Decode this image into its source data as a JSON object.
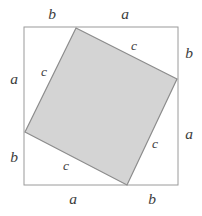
{
  "figure": {
    "type": "geometry-diagram",
    "name": "pythagorean-tilted-square",
    "background_color": "#ffffff",
    "outer_square": {
      "name": "outer-square",
      "stroke_color": "#9a9a9a",
      "fill_color": "none",
      "stroke_width": 1,
      "x": 24,
      "y": 27,
      "width": 154,
      "height": 158
    },
    "inner_square": {
      "name": "inner-tilted-square",
      "stroke_color": "#8c8c8c",
      "fill_color": "#d4d4d4",
      "stroke_width": 1.2,
      "points": "76,28 177,79 127,185 25,132"
    },
    "labels": {
      "top_left": {
        "text": "b",
        "x": 52,
        "y": 14
      },
      "top_right": {
        "text": "a",
        "x": 125,
        "y": 14
      },
      "right_top": {
        "text": "b",
        "x": 189,
        "y": 53
      },
      "right_bottom": {
        "text": "a",
        "x": 189,
        "y": 134
      },
      "bottom_right": {
        "text": "b",
        "x": 152,
        "y": 199
      },
      "bottom_left": {
        "text": "a",
        "x": 73,
        "y": 199
      },
      "left_bottom": {
        "text": "b",
        "x": 14,
        "y": 157
      },
      "left_top": {
        "text": "a",
        "x": 14,
        "y": 79
      },
      "hyp_top_right": {
        "text": "c",
        "x": 134,
        "y": 46
      },
      "hyp_right_bottom": {
        "text": "c",
        "x": 155,
        "y": 144
      },
      "hyp_bottom_left": {
        "text": "c",
        "x": 66,
        "y": 166
      },
      "hyp_left_top": {
        "text": "c",
        "x": 44,
        "y": 72
      }
    }
  }
}
